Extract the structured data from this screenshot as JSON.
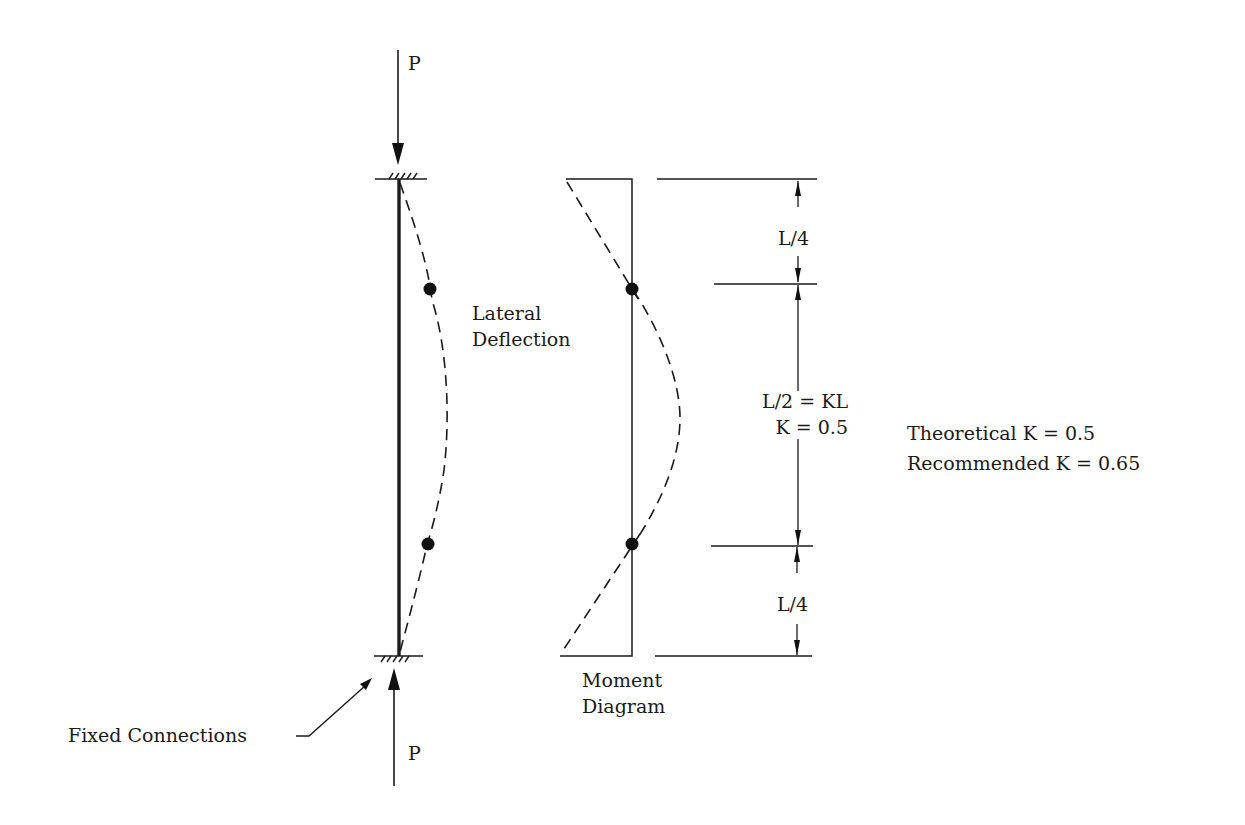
{
  "labels": {
    "top_load": "P",
    "bottom_load": "P",
    "lateral_line1": "Lateral",
    "lateral_line2": "Deflection",
    "moment_line1": "Moment",
    "moment_line2": "Diagram",
    "fixed_connections": "Fixed Connections",
    "dim_top": "L/4",
    "dim_mid_line1": "L/2 = KL",
    "dim_mid_line2": "K = 0.5",
    "dim_bottom": "L/4",
    "theoretical": "Theoretical K = 0.5",
    "recommended": "Recommended K = 0.65"
  },
  "colors": {
    "ink": "#1a1a1a",
    "background": "#ffffff"
  }
}
